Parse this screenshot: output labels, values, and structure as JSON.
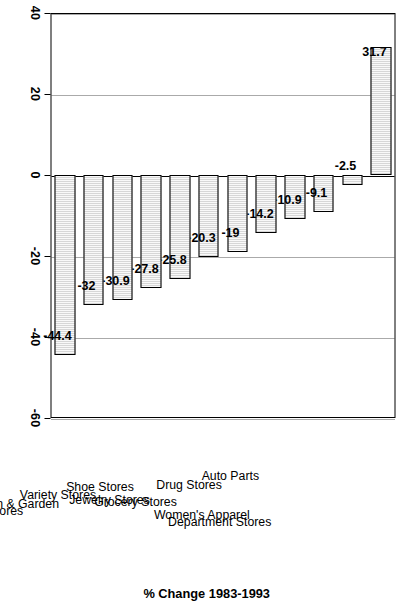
{
  "chart_data": {
    "type": "bar",
    "orientation": "horizontal",
    "title": "",
    "subtitle": "",
    "xlabel": "% Change 1983-1993",
    "ylabel": "Type of Store",
    "xlim": [
      -60,
      40
    ],
    "xticks": [
      -60,
      -40,
      -20,
      0,
      20,
      40
    ],
    "xtick_labels": [
      "-60",
      "-40",
      "-20",
      "0",
      "20",
      "40"
    ],
    "grid": true,
    "grid_axis": "x",
    "legend": null,
    "bar_fill_color": "#b9b9b9",
    "bar_edge_color": "#000000",
    "background_color": "#ffffff",
    "categories": [
      "Department Stores",
      "Women's Apparel",
      "Auto Parts",
      "Drug Stores",
      "Grocery Stores",
      "Jewelry Stores",
      "Shoe Stores",
      "Variety Stores",
      "Lawn & Garden",
      "Hardware Stores",
      "Misc. Apparel Stores",
      "Men's/Boy's Apparel"
    ],
    "values": [
      31.7,
      -2.5,
      -9.1,
      -10.9,
      -14.2,
      -19,
      -20.3,
      -25.8,
      -27.8,
      -30.9,
      -32,
      -44.4
    ],
    "value_labels": [
      "31.7",
      "-2.5",
      "-9.1",
      "-10.9",
      "-14.2",
      "-19",
      "-20.3",
      "-25.8",
      "-27.8",
      "-30.9",
      "-32",
      "-44.4"
    ]
  }
}
